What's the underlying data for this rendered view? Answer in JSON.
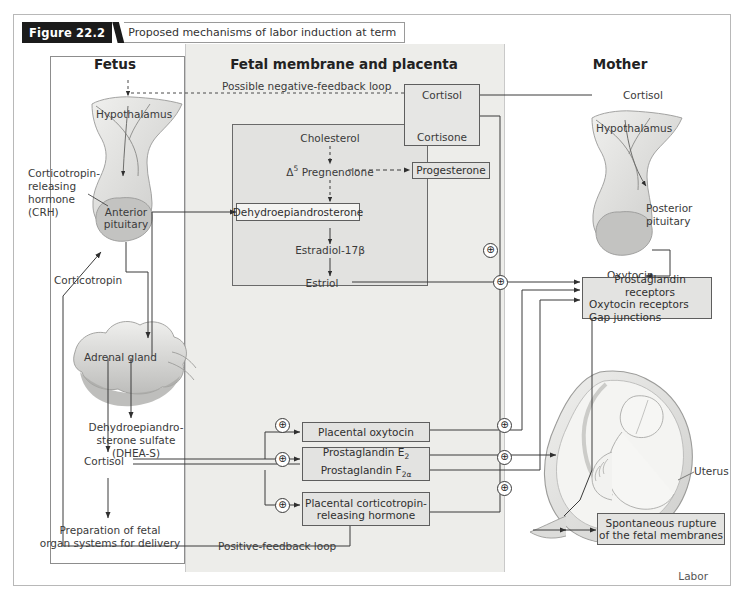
{
  "figure": {
    "number": "Figure 22.2",
    "title": "Proposed mechanisms of labor induction at term"
  },
  "columns": {
    "left": "Fetus",
    "center": "Fetal membrane and placenta",
    "right": "Mother"
  },
  "fetus": {
    "hypothalamus": "Hypothalamus",
    "crh": "Corticotropin-\nreleasing\nhormone\n(CRH)",
    "crh_line1": "Corticotropin-",
    "crh_line2": "releasing",
    "crh_line3": "hormone",
    "crh_line4": "(CRH)",
    "anterior_pituitary_line1": "Anterior",
    "anterior_pituitary_line2": "pituitary",
    "corticotropin": "Corticotropin",
    "adrenal_gland": "Adrenal gland",
    "dheas_line1": "Dehydroepiandro-",
    "dheas_line2": "sterone sulfate",
    "dheas_line3": "(DHEA-S)",
    "cortisol": "Cortisol",
    "preparation_line1": "Preparation of fetal",
    "preparation_line2": "organ systems for delivery"
  },
  "placenta": {
    "negative_feedback": "Possible negative-feedback loop",
    "cortisol": "Cortisol",
    "cortisone": "Cortisone",
    "progesterone": "Progesterone",
    "cholesterol": "Cholesterol",
    "pregnenolone": "Δ5 Pregnenolone",
    "pregnenolone_sup": "5",
    "pregnenolone_delta": "Δ",
    "pregnenolone_rest": " Pregnenolone",
    "dhea": "Dehydroepiandrosterone",
    "estradiol": "Estradiol-17β",
    "estriol": "Estriol",
    "placental_oxytocin": "Placental oxytocin",
    "prostaglandin_e2": "Prostaglandin E2",
    "prostaglandin_f2a": "Prostaglandin F2α",
    "placental_crh_line1": "Placental corticotropin-",
    "placental_crh_line2": "releasing hormone",
    "positive_feedback": "Positive-feedback loop"
  },
  "mother": {
    "cortisol": "Cortisol",
    "hypothalamus": "Hypothalamus",
    "posterior_pituitary_line1": "Posterior",
    "posterior_pituitary_line2": "pituitary",
    "oxytocin": "Oxytocin",
    "receptors_line1": "Prostaglandin receptors",
    "receptors_line2": "Oxytocin receptors",
    "receptors_line3": "Gap junctions",
    "uterus": "Uterus",
    "rupture_line1": "Spontaneous rupture",
    "rupture_line2": "of the fetal membranes",
    "labor": "Labor"
  },
  "symbols": {
    "plus": "⊕"
  },
  "colors": {
    "panel": "#ededea",
    "box_fill": "#e3e3e1",
    "stroke": "#5e5e5e",
    "text": "#3a3a3a",
    "title_bar": "#1b1b1b"
  }
}
